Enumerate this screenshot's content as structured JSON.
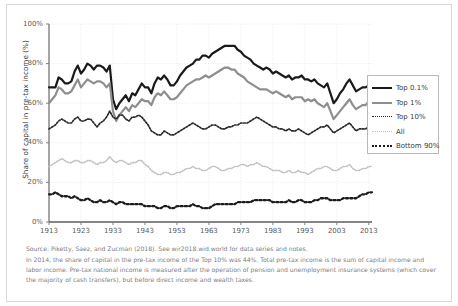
{
  "chart_data": {
    "type": "line",
    "title": "",
    "xlabel": "",
    "ylabel": "Share of capital in pre-tax income (%)",
    "xlim": [
      1913,
      2014
    ],
    "ylim": [
      0,
      100
    ],
    "grid": true,
    "legend_position": "right",
    "xticks": [
      "1913",
      "1923",
      "1933",
      "1943",
      "1953",
      "1963",
      "1973",
      "1983",
      "1993",
      "2003",
      "2013"
    ],
    "xtick_values": [
      1913,
      1923,
      1933,
      1943,
      1953,
      1963,
      1973,
      1983,
      1993,
      2003,
      2013
    ],
    "yticks": [
      "0%",
      "20%",
      "40%",
      "60%",
      "80%",
      "100%"
    ],
    "ytick_values": [
      0,
      20,
      40,
      60,
      80,
      100
    ],
    "x": [
      1913,
      1914,
      1915,
      1916,
      1917,
      1918,
      1919,
      1920,
      1921,
      1922,
      1923,
      1924,
      1925,
      1926,
      1927,
      1928,
      1929,
      1930,
      1931,
      1932,
      1933,
      1934,
      1935,
      1936,
      1937,
      1938,
      1939,
      1940,
      1941,
      1942,
      1943,
      1944,
      1945,
      1946,
      1947,
      1948,
      1949,
      1950,
      1951,
      1952,
      1953,
      1954,
      1955,
      1956,
      1957,
      1958,
      1959,
      1960,
      1961,
      1962,
      1963,
      1964,
      1965,
      1966,
      1967,
      1968,
      1969,
      1970,
      1971,
      1972,
      1973,
      1974,
      1975,
      1976,
      1977,
      1978,
      1979,
      1980,
      1981,
      1982,
      1983,
      1984,
      1985,
      1986,
      1987,
      1988,
      1989,
      1990,
      1991,
      1992,
      1993,
      1994,
      1995,
      1996,
      1997,
      1998,
      1999,
      2000,
      2001,
      2002,
      2003,
      2004,
      2005,
      2006,
      2007,
      2008,
      2009,
      2010,
      2011,
      2012,
      2013,
      2014
    ],
    "series": [
      {
        "name": "Top 0.1%",
        "style": "solid",
        "color": "#1a1a1a",
        "width": 2.2,
        "values": [
          68,
          68,
          68,
          73,
          72,
          70,
          70,
          71,
          76,
          79,
          75,
          77,
          80,
          79,
          77,
          79,
          79,
          78,
          76,
          79,
          62,
          57,
          60,
          62,
          64,
          61,
          65,
          64,
          67,
          70,
          68,
          68,
          65,
          70,
          73,
          72,
          74,
          72,
          69,
          69,
          71,
          74,
          76,
          78,
          79,
          80,
          82,
          82,
          84,
          84,
          83,
          85,
          86,
          87,
          88,
          89,
          89,
          89,
          89,
          87,
          86,
          84,
          83,
          82,
          80,
          79,
          78,
          77,
          78,
          77,
          75,
          76,
          75,
          74,
          73,
          74,
          72,
          73,
          73,
          74,
          72,
          72,
          71,
          72,
          70,
          69,
          68,
          70,
          65,
          60,
          62,
          65,
          67,
          70,
          72,
          69,
          66,
          67,
          68,
          68,
          69,
          69
        ]
      },
      {
        "name": "Top 1%",
        "style": "solid",
        "color": "#8e8e8e",
        "width": 2.2,
        "values": [
          60,
          62,
          64,
          68,
          67,
          65,
          65,
          66,
          69,
          72,
          68,
          70,
          72,
          71,
          70,
          71,
          71,
          70,
          68,
          70,
          56,
          51,
          54,
          56,
          58,
          56,
          59,
          58,
          60,
          62,
          61,
          61,
          59,
          63,
          65,
          64,
          66,
          64,
          62,
          62,
          63,
          65,
          67,
          69,
          70,
          71,
          72,
          72,
          73,
          74,
          73,
          74,
          75,
          76,
          77,
          78,
          78,
          77,
          77,
          75,
          74,
          73,
          71,
          70,
          69,
          68,
          67,
          67,
          67,
          66,
          65,
          66,
          65,
          64,
          63,
          64,
          62,
          63,
          63,
          63,
          61,
          62,
          61,
          62,
          60,
          59,
          58,
          60,
          56,
          52,
          54,
          56,
          58,
          60,
          62,
          59,
          57,
          58,
          59,
          59,
          61,
          61
        ]
      },
      {
        "name": "Top 10%",
        "style": "dotted",
        "color": "#2a2a2a",
        "width": 1.7,
        "values": [
          47,
          48,
          49,
          51,
          52,
          51,
          50,
          50,
          52,
          53,
          51,
          51,
          52,
          52,
          50,
          48,
          50,
          51,
          53,
          56,
          53,
          52,
          54,
          54,
          52,
          51,
          53,
          53,
          54,
          53,
          51,
          49,
          46,
          45,
          44,
          44,
          46,
          45,
          44,
          44,
          45,
          46,
          47,
          48,
          49,
          50,
          49,
          48,
          47,
          47,
          48,
          49,
          49,
          48,
          47,
          47,
          48,
          48,
          49,
          49,
          50,
          50,
          50,
          51,
          52,
          53,
          52,
          51,
          50,
          49,
          48,
          48,
          47,
          47,
          46,
          47,
          46,
          46,
          47,
          46,
          45,
          44,
          45,
          46,
          47,
          48,
          48,
          49,
          47,
          45,
          46,
          47,
          48,
          49,
          50,
          48,
          46,
          47,
          47,
          47,
          48,
          48
        ]
      },
      {
        "name": "All",
        "style": "dotted",
        "color": "#c2c2c2",
        "width": 1.6,
        "values": [
          28,
          29,
          30,
          31,
          32,
          31,
          30,
          30,
          31,
          31,
          30,
          30,
          31,
          31,
          30,
          29,
          30,
          30,
          31,
          33,
          31,
          30,
          31,
          31,
          30,
          29,
          30,
          30,
          31,
          31,
          29,
          28,
          26,
          25,
          24,
          24,
          25,
          25,
          24,
          24,
          25,
          25,
          26,
          27,
          27,
          28,
          27,
          27,
          26,
          26,
          27,
          28,
          28,
          27,
          26,
          26,
          27,
          27,
          28,
          28,
          29,
          29,
          28,
          29,
          29,
          30,
          29,
          28,
          28,
          27,
          26,
          26,
          26,
          25,
          25,
          26,
          25,
          25,
          26,
          25,
          25,
          24,
          25,
          26,
          27,
          27,
          28,
          28,
          27,
          26,
          26,
          27,
          28,
          28,
          29,
          27,
          26,
          26,
          27,
          27,
          28,
          28
        ]
      },
      {
        "name": "Bottom 90%",
        "style": "dotted",
        "color": "#1c1c1c",
        "width": 2.3,
        "values": [
          14,
          14,
          15,
          14,
          13,
          13,
          13,
          12,
          13,
          12,
          11,
          11,
          12,
          11,
          10,
          10,
          11,
          10,
          10,
          11,
          10,
          9,
          10,
          10,
          9,
          9,
          9,
          9,
          9,
          9,
          8,
          8,
          8,
          8,
          7,
          7,
          8,
          8,
          7,
          7,
          8,
          8,
          8,
          8,
          8,
          9,
          8,
          8,
          7,
          7,
          7,
          8,
          9,
          9,
          9,
          9,
          9,
          9,
          9,
          10,
          10,
          10,
          10,
          10,
          11,
          11,
          11,
          11,
          11,
          11,
          10,
          10,
          10,
          10,
          10,
          11,
          10,
          10,
          11,
          11,
          10,
          10,
          10,
          11,
          11,
          12,
          12,
          12,
          11,
          11,
          11,
          11,
          12,
          12,
          12,
          12,
          12,
          13,
          14,
          14,
          15,
          15
        ]
      }
    ]
  },
  "legend": {
    "items": [
      {
        "label": "Top 0.1%",
        "swatch": "sw-solid-black"
      },
      {
        "label": "Top 1%",
        "swatch": "sw-solid-gray"
      },
      {
        "label": "Top 10%",
        "swatch": "sw-dot-black"
      },
      {
        "label": "All",
        "swatch": "sw-dot-light"
      },
      {
        "label": "Bottom 90%",
        "swatch": "sw-dash-bold"
      }
    ]
  },
  "footnotes": {
    "source": "Source: Piketty, Saez, and Zucman (2018). See wir2018.wid.world for data series and notes.",
    "note": "In 2014, the share of capital in the pre-tax income of the Top 10% was 44%. Total pre-tax income is the sum of capital income and labor income. Pre-tax national income is measured after the operation of pension and unemployment insurance systems (which cover the majority of cash transfers), but before direct income and wealth taxes."
  }
}
